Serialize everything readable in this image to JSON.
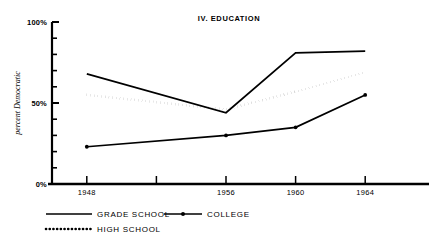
{
  "chart_data": {
    "type": "line",
    "title": "IV. EDUCATION",
    "xlabel": "",
    "ylabel": "percent Democratic",
    "x": [
      1948,
      1956,
      1960,
      1964
    ],
    "xlim": [
      1946,
      1966
    ],
    "ylim": [
      0,
      100
    ],
    "grid": false,
    "legend_position": "below",
    "y_tick_labels": [
      "0%",
      "50%",
      "100%"
    ],
    "y_tick_values": [
      0,
      50,
      100
    ],
    "y_minor_ticks": [
      10,
      20,
      30,
      40,
      60,
      70,
      80,
      90
    ],
    "x_tick_labels": [
      "1948",
      "",
      "1956",
      "1960",
      "1964"
    ],
    "x_tick_values": [
      1948,
      1952,
      1956,
      1960,
      1964
    ],
    "series": [
      {
        "name": "GRADE SCHOOL",
        "style": "solid",
        "marker": "none",
        "x": [
          1948,
          1956,
          1960,
          1964
        ],
        "values": [
          68,
          44,
          81,
          82
        ]
      },
      {
        "name": "HIGH SCHOOL",
        "style": "dotted",
        "marker": "none",
        "x": [
          1948,
          1956,
          1960,
          1964
        ],
        "values": [
          55,
          46,
          57,
          69
        ]
      },
      {
        "name": "COLLEGE",
        "style": "solid",
        "marker": "dot",
        "x": [
          1948,
          1956,
          1960,
          1964
        ],
        "values": [
          23,
          30,
          35,
          55
        ]
      }
    ]
  },
  "legend": {
    "entries": [
      {
        "label": "GRADE SCHOOL",
        "style": "solid",
        "marker": "none"
      },
      {
        "label": "COLLEGE",
        "style": "solid",
        "marker": "dot"
      },
      {
        "label": "HIGH SCHOOL",
        "style": "dotted",
        "marker": "none"
      }
    ]
  },
  "colors": {
    "ink": "#000000",
    "background": "#ffffff"
  }
}
